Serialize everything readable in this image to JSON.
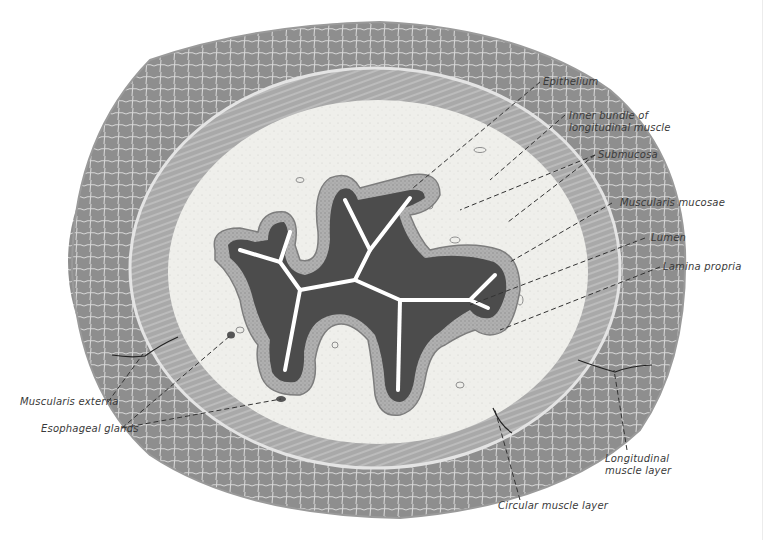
{
  "figure": {
    "colors": {
      "background": "#ffffff",
      "outer_muscle": "#8c8c8c",
      "outer_muscle_light": "#b4b4b4",
      "circular_muscle": "#a8a8a8",
      "submucosa": "#eeeeea",
      "mucosa_band": "#9a9a9a",
      "epithelium_dark": "#4a4a4a",
      "lumen": "#ffffff",
      "leader_line": "#333333",
      "label_text": "#3a3a3a"
    }
  },
  "labels": {
    "epithelium": "Epithelium",
    "inner_bundle_line1": "Inner bundle of",
    "inner_bundle_line2": "longitudinal muscle",
    "submucosa": "Submucosa",
    "muscularis_mucosae": "Muscularis mucosae",
    "lumen": "Lumen",
    "lamina_propria": "Lamina propria",
    "muscularis_externa": "Muscularis externa",
    "esophageal_glands": "Esophageal glands",
    "longitudinal_line1": "Longitudinal",
    "longitudinal_line2": "muscle layer",
    "circular_muscle_layer": "Circular muscle layer"
  }
}
